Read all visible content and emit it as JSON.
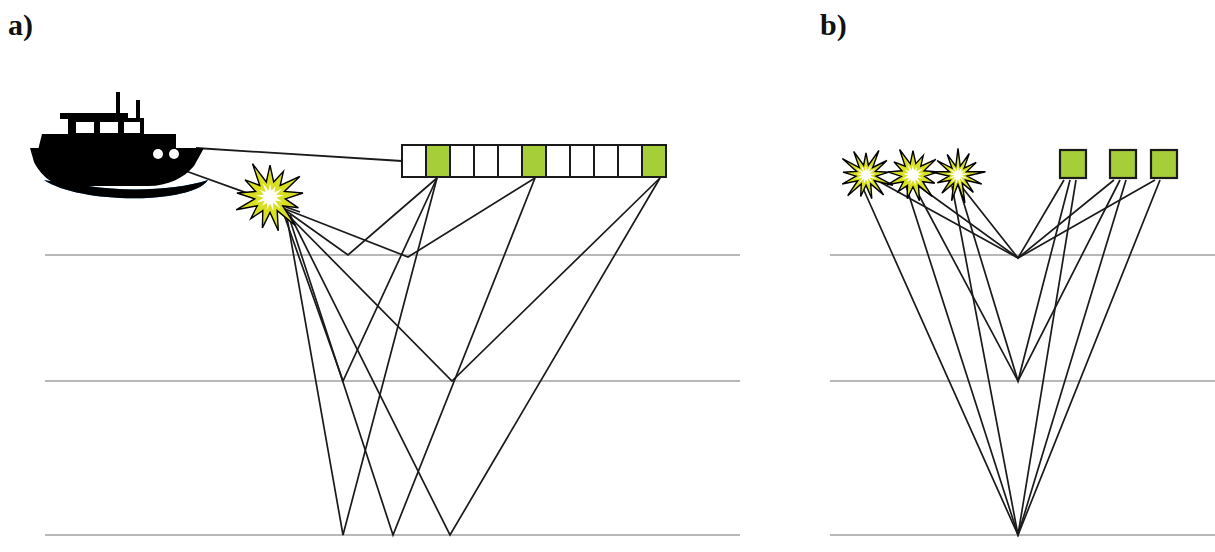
{
  "figure": {
    "kind": "seismic-acquisition-diagram",
    "width": 1215,
    "height": 552,
    "background": "#ffffff"
  },
  "panels": [
    {
      "id": "a",
      "label": "a)",
      "label_pos": {
        "x": 8,
        "y": 8
      },
      "description": "Marine seismic survey: vessel tows an air-gun source and a receiver streamer; ray paths from the source reflect off three subsurface horizons back up to selected receivers.",
      "boat": {
        "name": "survey-vessel",
        "hull_color": "#000000",
        "wake_color": "#1f7fd4",
        "x": 30,
        "y": 92,
        "width": 180,
        "height": 90
      },
      "source": {
        "name": "airgun-source",
        "label": "",
        "x": 270,
        "y": 197,
        "star_fill": "#d9e021",
        "star_core": "#ffffff",
        "star_stroke": "#000000",
        "radius": 34
      },
      "streamer": {
        "name": "receiver-streamer",
        "x": 402,
        "y": 145,
        "cell_width": 24,
        "cell_height": 32,
        "cell_count": 11,
        "active_indices": [
          1,
          5,
          10
        ],
        "active_fill": "#a6ce39",
        "inactive_fill": "#ffffff",
        "stroke": "#1a1a1a"
      },
      "tow_lines": [
        {
          "name": "streamer-tow-line",
          "x1": 196,
          "y1": 148,
          "x2": 402,
          "y2": 161
        },
        {
          "name": "source-tow-line",
          "x1": 183,
          "y1": 170,
          "x2": 300,
          "y2": 212
        }
      ],
      "reflectors": [
        {
          "name": "reflector-shallow",
          "depth_y": 255,
          "x1": 45,
          "x2": 740,
          "color": "#b8b8b8"
        },
        {
          "name": "reflector-middle",
          "depth_y": 381,
          "x1": 45,
          "x2": 740,
          "color": "#b8b8b8"
        },
        {
          "name": "reflector-deep",
          "depth_y": 535,
          "x1": 45,
          "x2": 740,
          "color": "#b8b8b8"
        }
      ],
      "raypaths": [
        {
          "name": "raypath-shallow-to-rx1",
          "source_x": 278,
          "source_y": 205,
          "bounce_x": 348,
          "bounce_y": 255,
          "receiver_x": 437,
          "receiver_y": 178
        },
        {
          "name": "raypath-shallow-to-rx2",
          "source_x": 280,
          "source_y": 207,
          "bounce_x": 408,
          "bounce_y": 257,
          "receiver_x": 535,
          "receiver_y": 178
        },
        {
          "name": "raypath-middle-to-rx1",
          "source_x": 282,
          "source_y": 209,
          "bounce_x": 343,
          "bounce_y": 381,
          "receiver_x": 437,
          "receiver_y": 178
        },
        {
          "name": "raypath-middle-to-rx3",
          "source_x": 284,
          "source_y": 211,
          "bounce_x": 452,
          "bounce_y": 381,
          "receiver_x": 660,
          "receiver_y": 178
        },
        {
          "name": "raypath-deep-to-rx1",
          "source_x": 286,
          "source_y": 212,
          "bounce_x": 343,
          "bounce_y": 535,
          "receiver_x": 437,
          "receiver_y": 178
        },
        {
          "name": "raypath-deep-to-rx2",
          "source_x": 288,
          "source_y": 214,
          "bounce_x": 393,
          "bounce_y": 535,
          "receiver_x": 535,
          "receiver_y": 178
        },
        {
          "name": "raypath-deep-to-rx3",
          "source_x": 290,
          "source_y": 215,
          "bounce_x": 450,
          "bounce_y": 535,
          "receiver_x": 660,
          "receiver_y": 178
        }
      ]
    },
    {
      "id": "b",
      "label": "b)",
      "label_pos": {
        "x": 820,
        "y": 8
      },
      "description": "Equivalent common-midpoint gather: three source positions and three receiver positions whose ray paths share a single reflection point at each horizon.",
      "sources": [
        {
          "name": "source-star-1",
          "x": 866,
          "y": 175,
          "radius": 26
        },
        {
          "name": "source-star-2",
          "x": 913,
          "y": 175,
          "radius": 26
        },
        {
          "name": "source-star-3",
          "x": 958,
          "y": 175,
          "radius": 26
        }
      ],
      "source_style": {
        "star_fill": "#d9e021",
        "star_core": "#ffffff",
        "star_stroke": "#000000"
      },
      "receivers": [
        {
          "name": "receiver-square-1",
          "x": 1060,
          "y": 150,
          "width": 26,
          "height": 28
        },
        {
          "name": "receiver-square-2",
          "x": 1110,
          "y": 150,
          "width": 26,
          "height": 28
        },
        {
          "name": "receiver-square-3",
          "x": 1151,
          "y": 150,
          "width": 26,
          "height": 28
        }
      ],
      "receiver_style": {
        "fill": "#a6ce39",
        "stroke": "#1a1a1a"
      },
      "reflectors": [
        {
          "name": "reflector-shallow",
          "depth_y": 255,
          "x1": 830,
          "x2": 1215,
          "color": "#b8b8b8"
        },
        {
          "name": "reflector-middle",
          "depth_y": 381,
          "x1": 830,
          "x2": 1215,
          "color": "#b8b8b8"
        },
        {
          "name": "reflector-deep",
          "depth_y": 535,
          "x1": 830,
          "x2": 1215,
          "color": "#b8b8b8"
        }
      ],
      "midpoint_x": 1018,
      "raypaths": [
        {
          "name": "cmp-raypath-shallow-near",
          "source_x": 958,
          "source_y": 182,
          "bounce_x": 1018,
          "bounce_y": 258,
          "receiver_x": 1064,
          "receiver_y": 180
        },
        {
          "name": "cmp-raypath-shallow-mid",
          "source_x": 913,
          "source_y": 182,
          "bounce_x": 1018,
          "bounce_y": 258,
          "receiver_x": 1114,
          "receiver_y": 180
        },
        {
          "name": "cmp-raypath-shallow-far",
          "source_x": 880,
          "source_y": 182,
          "bounce_x": 1018,
          "bounce_y": 258,
          "receiver_x": 1155,
          "receiver_y": 180
        },
        {
          "name": "cmp-raypath-middle-near",
          "source_x": 958,
          "source_y": 184,
          "bounce_x": 1018,
          "bounce_y": 381,
          "receiver_x": 1070,
          "receiver_y": 180
        },
        {
          "name": "cmp-raypath-middle-mid",
          "source_x": 913,
          "source_y": 184,
          "bounce_x": 1018,
          "bounce_y": 381,
          "receiver_x": 1120,
          "receiver_y": 180
        },
        {
          "name": "cmp-raypath-deep-near",
          "source_x": 952,
          "source_y": 186,
          "bounce_x": 1018,
          "bounce_y": 535,
          "receiver_x": 1076,
          "receiver_y": 180
        },
        {
          "name": "cmp-raypath-deep-mid",
          "source_x": 906,
          "source_y": 186,
          "bounce_x": 1018,
          "bounce_y": 535,
          "receiver_x": 1126,
          "receiver_y": 180
        },
        {
          "name": "cmp-raypath-deep-far",
          "source_x": 862,
          "source_y": 186,
          "bounce_x": 1018,
          "bounce_y": 535,
          "receiver_x": 1160,
          "receiver_y": 180
        }
      ]
    }
  ],
  "style": {
    "ray_color": "#1a1a1a",
    "ray_width": 1.7,
    "reflector_color": "#b8b8b8",
    "reflector_width": 2,
    "label_color": "#111111"
  }
}
